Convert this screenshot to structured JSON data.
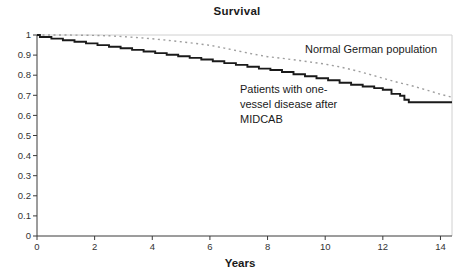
{
  "chart": {
    "title": "Survival",
    "xlabel": "Years",
    "annotations": {
      "normal_population": "Normal German population",
      "patients_lines": [
        "Patients with one-",
        "vessel disease after",
        "MIDCAB"
      ]
    }
  },
  "chart_data": {
    "type": "line",
    "title": "Survival",
    "xlabel": "Years",
    "ylabel": "",
    "xlim": [
      0,
      14.4
    ],
    "ylim": [
      0,
      1
    ],
    "xticks": [
      0,
      2,
      4,
      6,
      8,
      10,
      12,
      14
    ],
    "yticks": [
      0,
      0.1,
      0.2,
      0.3,
      0.4,
      0.5,
      0.6,
      0.7,
      0.8,
      0.9,
      1
    ],
    "grid": false,
    "legend_position": "inline-annotations",
    "colors": {
      "solid_series": "#1a1a1a",
      "dashed_series": "#9e9e9e",
      "axis": "#3a3a3a",
      "plot_border": "#d0d0d0",
      "tick_text": "#333333"
    },
    "series": [
      {
        "name": "Normal German population",
        "style": "dashed",
        "interpolation": "linear",
        "points": [
          [
            0,
            1.0
          ],
          [
            1,
            1.0
          ],
          [
            2,
            0.998
          ],
          [
            2.5,
            0.996
          ],
          [
            3,
            0.992
          ],
          [
            3.5,
            0.987
          ],
          [
            4,
            0.981
          ],
          [
            4.5,
            0.974
          ],
          [
            5,
            0.966
          ],
          [
            5.5,
            0.958
          ],
          [
            6,
            0.949
          ],
          [
            6.5,
            0.935
          ],
          [
            7,
            0.92
          ],
          [
            7.5,
            0.905
          ],
          [
            8,
            0.892
          ],
          [
            8.5,
            0.884
          ],
          [
            9,
            0.875
          ],
          [
            9.5,
            0.865
          ],
          [
            10,
            0.855
          ],
          [
            10.5,
            0.842
          ],
          [
            11,
            0.825
          ],
          [
            11.5,
            0.806
          ],
          [
            12,
            0.785
          ],
          [
            12.5,
            0.765
          ],
          [
            13,
            0.748
          ],
          [
            13.5,
            0.727
          ],
          [
            14,
            0.705
          ],
          [
            14.4,
            0.69
          ]
        ]
      },
      {
        "name": "Patients with one-vessel disease after MIDCAB",
        "style": "solid",
        "interpolation": "step-after",
        "points": [
          [
            0,
            1.0
          ],
          [
            0.1,
            0.99
          ],
          [
            0.5,
            0.982
          ],
          [
            0.9,
            0.974
          ],
          [
            1.3,
            0.966
          ],
          [
            1.7,
            0.958
          ],
          [
            2.1,
            0.95
          ],
          [
            2.5,
            0.942
          ],
          [
            2.9,
            0.934
          ],
          [
            3.3,
            0.926
          ],
          [
            3.7,
            0.918
          ],
          [
            4.1,
            0.91
          ],
          [
            4.5,
            0.902
          ],
          [
            4.9,
            0.894
          ],
          [
            5.3,
            0.886
          ],
          [
            5.7,
            0.878
          ],
          [
            6.1,
            0.869
          ],
          [
            6.5,
            0.86
          ],
          [
            6.9,
            0.851
          ],
          [
            7.3,
            0.842
          ],
          [
            7.7,
            0.833
          ],
          [
            8.1,
            0.826
          ],
          [
            8.5,
            0.816
          ],
          [
            8.9,
            0.805
          ],
          [
            9.3,
            0.795
          ],
          [
            9.7,
            0.785
          ],
          [
            10.1,
            0.775
          ],
          [
            10.5,
            0.762
          ],
          [
            10.9,
            0.752
          ],
          [
            11.3,
            0.744
          ],
          [
            11.7,
            0.736
          ],
          [
            12.0,
            0.728
          ],
          [
            12.3,
            0.707
          ],
          [
            12.6,
            0.698
          ],
          [
            12.75,
            0.678
          ],
          [
            12.9,
            0.665
          ],
          [
            14.4,
            0.665
          ]
        ]
      }
    ]
  }
}
